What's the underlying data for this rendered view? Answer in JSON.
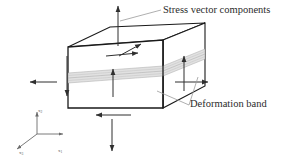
{
  "figure": {
    "title_region": "stress-vector-components-on-cuboid-with-deformation-band",
    "background_color": "#ffffff",
    "width": 284,
    "height": 162
  },
  "annotations": {
    "stress_label": "Stress vector components",
    "band_label": "Deformation band"
  },
  "axes": {
    "x1": {
      "name": "x",
      "subscript": "1"
    },
    "x2": {
      "name": "x",
      "subscript": "2"
    },
    "x3": {
      "name": "x",
      "subscript": "3"
    }
  },
  "colors": {
    "outline": "#1a1a1a",
    "hidden_edge": "#8c8c8c",
    "arrow": "#2f2f2f",
    "leader": "#9a9a9a",
    "band_fill": "#d8d8d8",
    "band_line": "#b0b0b0",
    "axis": "#6b6b6b",
    "text": "#2b2b2b"
  },
  "geometry": {
    "box": {
      "front_face": [
        [
          68,
          47
        ],
        [
          68,
          108
        ],
        [
          163,
          108
        ],
        [
          163,
          40
        ]
      ],
      "top_face": [
        [
          68,
          47
        ],
        [
          110,
          27
        ],
        [
          205,
          23
        ],
        [
          163,
          40
        ]
      ],
      "right_face": [
        [
          163,
          40
        ],
        [
          205,
          23
        ],
        [
          205,
          86
        ],
        [
          163,
          108
        ]
      ]
    },
    "deformation_band": {
      "front_top_y": 72,
      "front_bottom_y": 82,
      "right_top": [
        [
          163,
          72
        ],
        [
          205,
          55
        ]
      ],
      "right_bottom": [
        [
          163,
          82
        ],
        [
          205,
          64
        ]
      ],
      "stripe_count": 5
    }
  },
  "arrows": [
    {
      "name": "top-face-normal-up",
      "from": [
        118,
        46
      ],
      "to": [
        118,
        5
      ],
      "head": "up"
    },
    {
      "name": "top-face-shear-right",
      "from": [
        106,
        57
      ],
      "to": [
        139,
        53
      ],
      "head": "right"
    },
    {
      "name": "top-face-shear-oblique",
      "from": [
        119,
        57
      ],
      "to": [
        142,
        43
      ],
      "head": "up-right"
    },
    {
      "name": "front-face-normal-up",
      "from": [
        113,
        97
      ],
      "to": [
        113,
        70
      ],
      "head": "up"
    },
    {
      "name": "left-edge-shear-down",
      "from": [
        67,
        56
      ],
      "to": [
        67,
        95
      ],
      "head": "down"
    },
    {
      "name": "left-side-normal-left",
      "from": [
        56,
        82
      ],
      "to": [
        30,
        82
      ],
      "head": "left"
    },
    {
      "name": "bottom-shear-left",
      "from": [
        130,
        115
      ],
      "to": [
        96,
        115
      ],
      "head": "left"
    },
    {
      "name": "bottom-normal-down",
      "from": [
        112,
        118
      ],
      "to": [
        112,
        150
      ],
      "head": "down"
    },
    {
      "name": "right-face-normal-right",
      "from": [
        175,
        82
      ],
      "to": [
        207,
        82
      ],
      "head": "right"
    },
    {
      "name": "right-face-shear-up",
      "from": [
        184,
        90
      ],
      "to": [
        184,
        57
      ],
      "head": "up"
    }
  ],
  "leaders": [
    {
      "name": "stress-leader",
      "points": [
        [
          121,
          20
        ],
        [
          160,
          10
        ]
      ]
    },
    {
      "name": "band-leader-upper",
      "points": [
        [
          158,
          90
        ],
        [
          188,
          104
        ]
      ]
    },
    {
      "name": "band-leader-lower",
      "points": [
        [
          197,
          76
        ],
        [
          188,
          104
        ]
      ]
    }
  ]
}
